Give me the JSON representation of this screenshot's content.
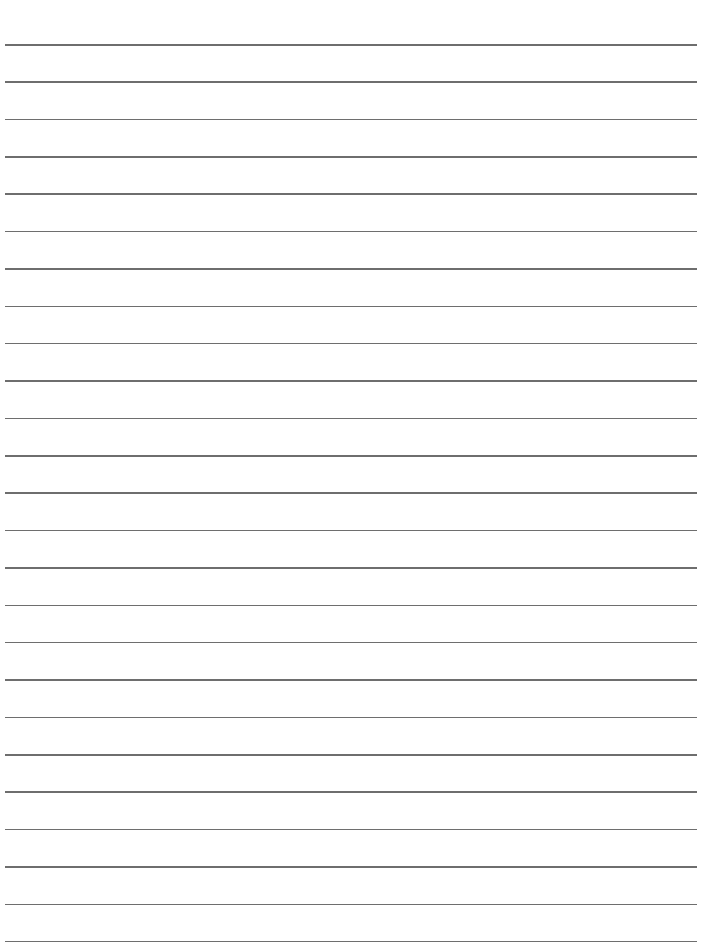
{
  "page": {
    "type": "lined-paper",
    "line_count": 25,
    "line_color": "#6e6e6e",
    "background": "#ffffff",
    "first_line_y": 44,
    "line_spacing": 37.37
  }
}
